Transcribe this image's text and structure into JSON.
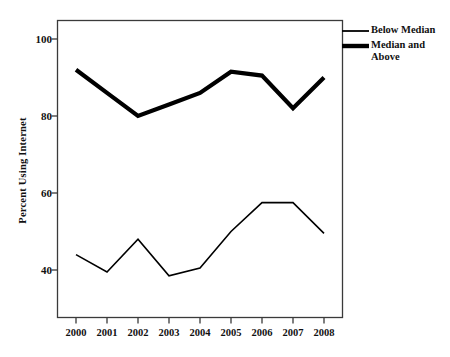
{
  "chart_data": {
    "type": "line",
    "title": "",
    "xlabel": "",
    "ylabel": "Percent Using Internet",
    "categories": [
      "2000",
      "2001",
      "2002",
      "2003",
      "2004",
      "2005",
      "2006",
      "2007",
      "2008"
    ],
    "x": [
      2000,
      2001,
      2002,
      2003,
      2004,
      2005,
      2006,
      2007,
      2008
    ],
    "ylim": [
      30,
      105
    ],
    "xlim": [
      1999.5,
      2008.6
    ],
    "yticks": [
      40,
      60,
      80,
      100
    ],
    "ytick_labels": [
      "40",
      "60",
      "80",
      "100"
    ],
    "grid": false,
    "legend_position": "right-top-outside",
    "series": [
      {
        "name": "Below Median",
        "style": "thin",
        "color": "#000000",
        "line_width": 1.6,
        "values": [
          44,
          39.5,
          48,
          38.5,
          40.5,
          50,
          57.5,
          57.5,
          49.5
        ]
      },
      {
        "name": "Median and Above",
        "style": "thick",
        "color": "#000000",
        "line_width": 4.2,
        "values": [
          92,
          86,
          80,
          83,
          86,
          91.5,
          90.5,
          82,
          90
        ]
      }
    ]
  },
  "legend": {
    "items": [
      {
        "label": "Below Median",
        "swatch": "thin-line-swatch"
      },
      {
        "label": "Median and\nAbove",
        "swatch": "thick-line-swatch"
      }
    ]
  },
  "axes": {
    "y_title": "Percent Using Internet",
    "y_labels": [
      "100",
      "80",
      "60",
      "40"
    ],
    "x_labels": [
      "2000",
      "2001",
      "2002",
      "2003",
      "2004",
      "2005",
      "2006",
      "2007",
      "2008"
    ]
  },
  "colors": {
    "line": "#000000",
    "frame": "#3a3a3a",
    "background": "#ffffff",
    "text": "#111111"
  }
}
